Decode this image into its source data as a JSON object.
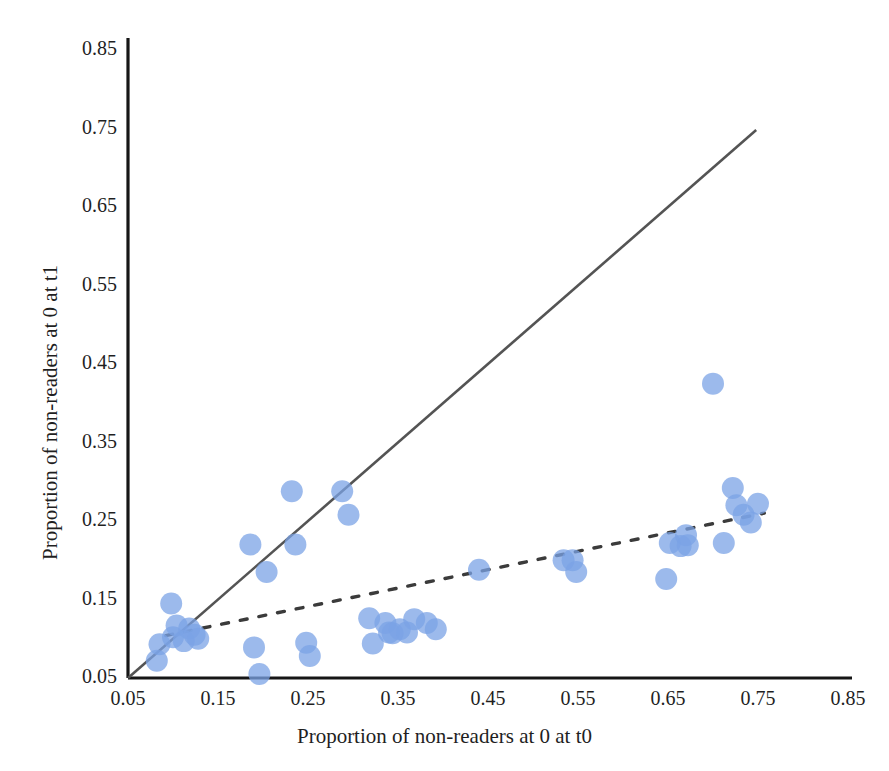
{
  "figure": {
    "background_color": "#ffffff",
    "width": 889,
    "height": 771
  },
  "axes": {
    "x_title": "Proportion of non-readers at 0 at t0",
    "y_title": "Proportion of non-readers at 0 at t1",
    "x_ticks": [
      "0.05",
      "0.15",
      "0.25",
      "0.35",
      "0.45",
      "0.55",
      "0.65",
      "0.75",
      "0.85"
    ],
    "y_ticks": [
      "0.05",
      "0.15",
      "0.25",
      "0.35",
      "0.45",
      "0.55",
      "0.65",
      "0.75",
      "0.85"
    ],
    "axis_color": "#161616"
  },
  "chart_data": {
    "type": "scatter",
    "title": "",
    "xlabel": "Proportion of non-readers at 0 at t0",
    "ylabel": "Proportion of non-readers at 0 at t1",
    "xlim": [
      0.05,
      0.85
    ],
    "ylim": [
      0.05,
      0.85
    ],
    "xticks": [
      0.05,
      0.15,
      0.25,
      0.35,
      0.45,
      0.55,
      0.65,
      0.75,
      0.85
    ],
    "yticks": [
      0.05,
      0.15,
      0.25,
      0.35,
      0.45,
      0.55,
      0.65,
      0.75,
      0.85
    ],
    "grid": false,
    "legend": "none",
    "marker_color": "#7ba3e6",
    "marker_opacity": 0.75,
    "marker_radius_px": 11,
    "series": [
      {
        "name": "Schools",
        "points": [
          [
            0.082,
            0.072
          ],
          [
            0.085,
            0.093
          ],
          [
            0.098,
            0.145
          ],
          [
            0.1,
            0.102
          ],
          [
            0.104,
            0.117
          ],
          [
            0.112,
            0.097
          ],
          [
            0.118,
            0.113
          ],
          [
            0.124,
            0.105
          ],
          [
            0.128,
            0.1
          ],
          [
            0.186,
            0.22
          ],
          [
            0.19,
            0.089
          ],
          [
            0.196,
            0.055
          ],
          [
            0.204,
            0.185
          ],
          [
            0.232,
            0.288
          ],
          [
            0.236,
            0.22
          ],
          [
            0.248,
            0.095
          ],
          [
            0.252,
            0.078
          ],
          [
            0.288,
            0.288
          ],
          [
            0.295,
            0.258
          ],
          [
            0.318,
            0.126
          ],
          [
            0.322,
            0.094
          ],
          [
            0.336,
            0.12
          ],
          [
            0.34,
            0.108
          ],
          [
            0.344,
            0.107
          ],
          [
            0.352,
            0.112
          ],
          [
            0.36,
            0.108
          ],
          [
            0.368,
            0.125
          ],
          [
            0.382,
            0.12
          ],
          [
            0.392,
            0.112
          ],
          [
            0.44,
            0.188
          ],
          [
            0.534,
            0.2
          ],
          [
            0.544,
            0.2
          ],
          [
            0.548,
            0.185
          ],
          [
            0.648,
            0.176
          ],
          [
            0.652,
            0.222
          ],
          [
            0.664,
            0.218
          ],
          [
            0.67,
            0.232
          ],
          [
            0.672,
            0.219
          ],
          [
            0.7,
            0.425
          ],
          [
            0.712,
            0.222
          ],
          [
            0.722,
            0.292
          ],
          [
            0.726,
            0.27
          ],
          [
            0.734,
            0.258
          ],
          [
            0.742,
            0.248
          ],
          [
            0.75,
            0.272
          ]
        ]
      }
    ],
    "reference_lines": [
      {
        "name": "identity-line",
        "style": "solid",
        "color": "#545454",
        "x0": 0.05,
        "y0": 0.05,
        "x1": 0.748,
        "y1": 0.748
      },
      {
        "name": "fit-line",
        "style": "dashed",
        "color": "#3b3b3b",
        "x0": 0.092,
        "y0": 0.104,
        "x1": 0.757,
        "y1": 0.26
      }
    ]
  }
}
